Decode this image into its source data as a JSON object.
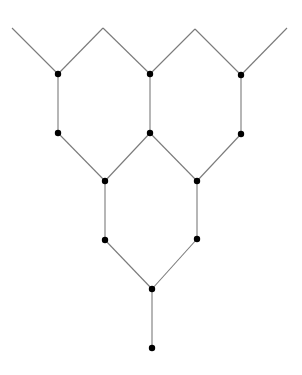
{
  "diagram": {
    "type": "graph",
    "colors": {
      "edge": "#7a7a7a",
      "node": "#000000",
      "background": "#ffffff"
    },
    "node_radius": 3.2,
    "nodes": [
      {
        "id": "A",
        "x": 58,
        "y": 74
      },
      {
        "id": "B",
        "x": 150,
        "y": 74
      },
      {
        "id": "C",
        "x": 241,
        "y": 75
      },
      {
        "id": "D",
        "x": 58,
        "y": 133
      },
      {
        "id": "E",
        "x": 150,
        "y": 133
      },
      {
        "id": "F",
        "x": 241,
        "y": 134
      },
      {
        "id": "G",
        "x": 105,
        "y": 181
      },
      {
        "id": "H",
        "x": 197,
        "y": 181
      },
      {
        "id": "I",
        "x": 105,
        "y": 240
      },
      {
        "id": "J",
        "x": 197,
        "y": 239
      },
      {
        "id": "K",
        "x": 152,
        "y": 289
      },
      {
        "id": "L",
        "x": 152,
        "y": 348
      }
    ],
    "open_ends": [
      {
        "id": "P1",
        "x": 12,
        "y": 28
      },
      {
        "id": "P2",
        "x": 103,
        "y": 28
      },
      {
        "id": "P3",
        "x": 195,
        "y": 29
      },
      {
        "id": "P4",
        "x": 287,
        "y": 28
      }
    ],
    "edges": [
      [
        "P1",
        "A"
      ],
      [
        "A",
        "P2"
      ],
      [
        "P2",
        "B"
      ],
      [
        "B",
        "P3"
      ],
      [
        "P3",
        "C"
      ],
      [
        "C",
        "P4"
      ],
      [
        "A",
        "D"
      ],
      [
        "B",
        "E"
      ],
      [
        "C",
        "F"
      ],
      [
        "D",
        "G"
      ],
      [
        "G",
        "E"
      ],
      [
        "E",
        "H"
      ],
      [
        "H",
        "F"
      ],
      [
        "G",
        "I"
      ],
      [
        "H",
        "J"
      ],
      [
        "I",
        "K"
      ],
      [
        "K",
        "J"
      ],
      [
        "K",
        "L"
      ]
    ]
  }
}
